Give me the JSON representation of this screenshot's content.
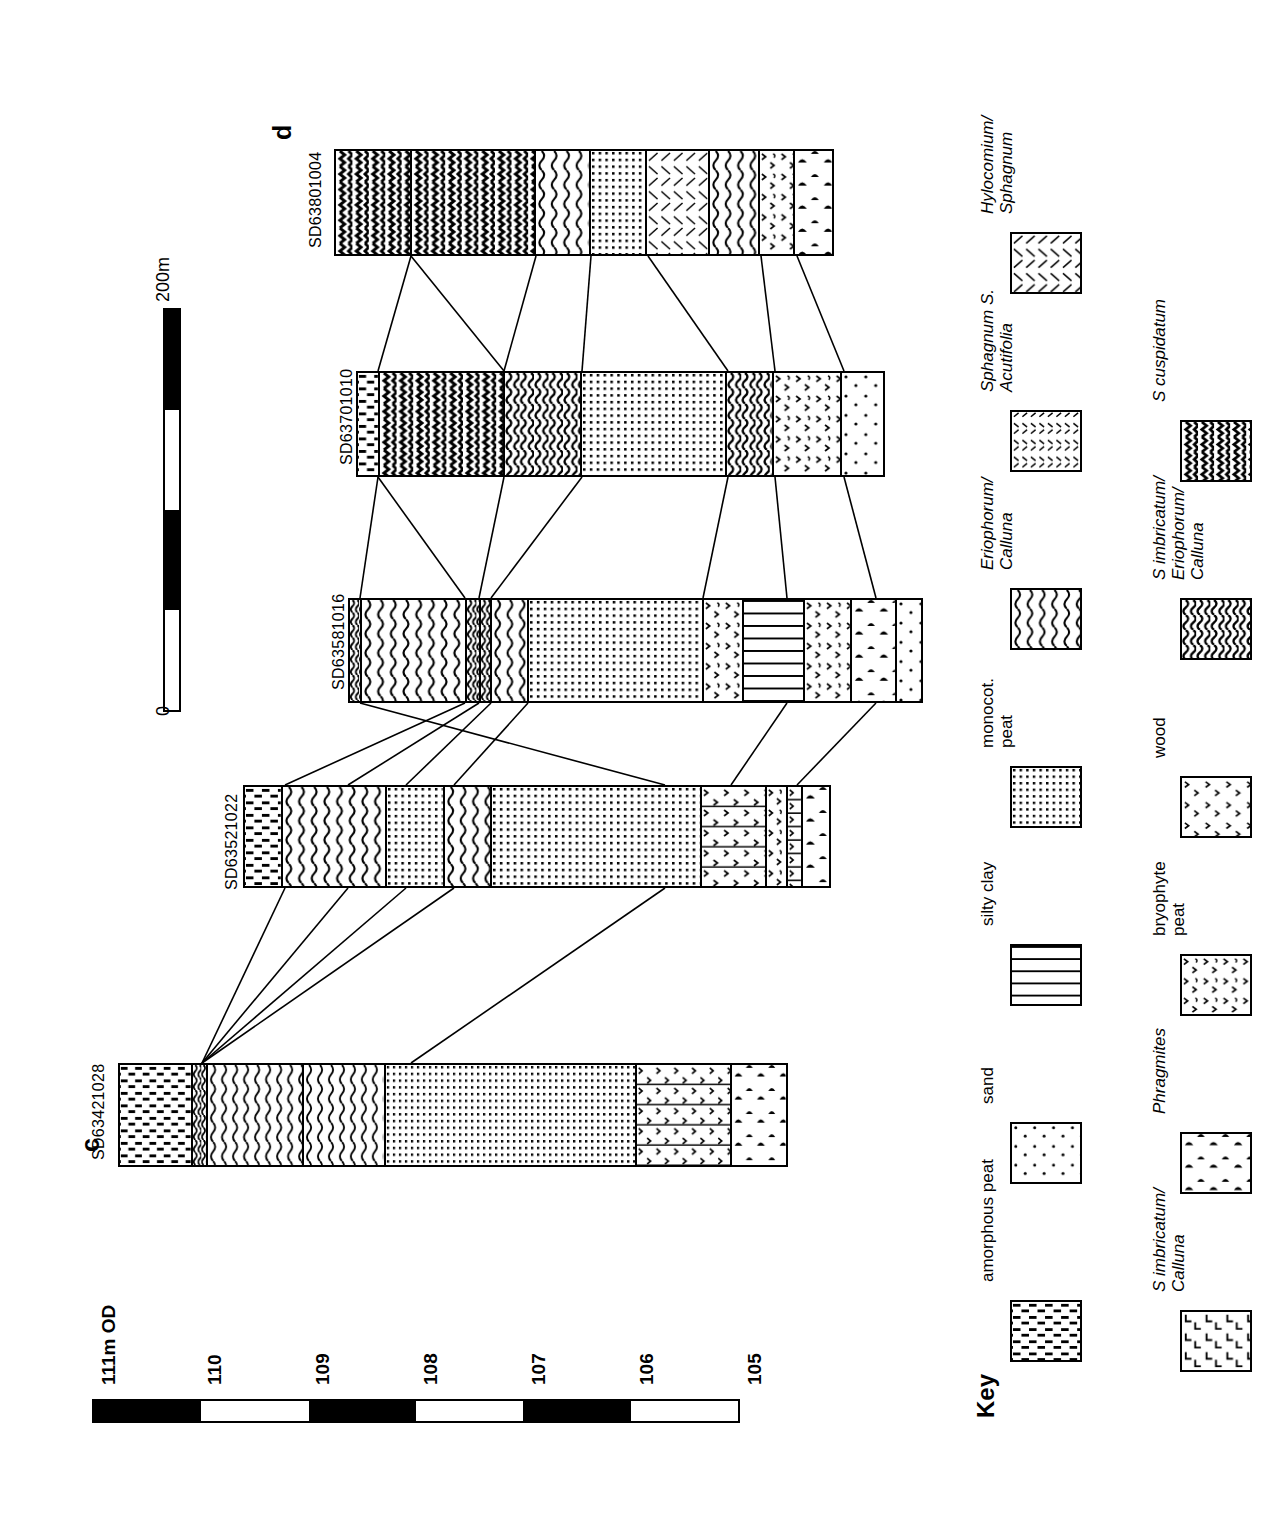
{
  "figure": {
    "panel_labels": [
      {
        "text": "c",
        "x": 76,
        "y": 1152
      },
      {
        "text": "d",
        "x": 268,
        "y": 140
      }
    ]
  },
  "elevation_scale": {
    "name": "elevation-scale",
    "unit_label": "111m OD",
    "ticks": [
      "110",
      "109",
      "108",
      "107",
      "106",
      "105"
    ],
    "segments": [
      "black",
      "white",
      "black",
      "white",
      "black",
      "white"
    ]
  },
  "distance_scale": {
    "name": "distance-scale",
    "start_label": "0",
    "end_label": "200m",
    "segments": [
      "black",
      "white",
      "black",
      "white"
    ]
  },
  "cores": [
    {
      "id": "SD63421028",
      "label_x": 90,
      "label_y": 1160,
      "bar": {
        "x": 118,
        "y": 1063,
        "w": 670,
        "h": 104
      },
      "layers": [
        {
          "name": "amorphous peat",
          "pattern": "amorphous",
          "width": 84
        },
        {
          "name": "S imbricatum/Calluna",
          "pattern": "simb",
          "width": 18
        },
        {
          "name": "Eriophorum/Calluna",
          "pattern": "erio",
          "width": 111
        },
        {
          "name": "Eriophorum/Calluna",
          "pattern": "erio",
          "width": 94
        },
        {
          "name": "monocot. peat",
          "pattern": "monocot",
          "width": 291
        },
        {
          "name": "bryophyte peat + silty clay",
          "pattern": "bryo-silty",
          "width": 110
        },
        {
          "name": "Phragmites peat",
          "pattern": "phrag",
          "width": 62
        }
      ]
    },
    {
      "id": "SD63521022",
      "label_x": 223,
      "label_y": 890,
      "bar": {
        "x": 243,
        "y": 785,
        "w": 588,
        "h": 103
      },
      "layers": [
        {
          "name": "amorphous peat",
          "pattern": "amorphous",
          "width": 38
        },
        {
          "name": "Eriophorum/Calluna",
          "pattern": "erio",
          "width": 105
        },
        {
          "name": "monocot. peat",
          "pattern": "monocot",
          "width": 58
        },
        {
          "name": "Eriophorum/Calluna",
          "pattern": "erio",
          "width": 48
        },
        {
          "name": "monocot. peat",
          "pattern": "monocot",
          "width": 211
        },
        {
          "name": "bryophyte peat + silty clay",
          "pattern": "bryo-silty",
          "width": 66
        },
        {
          "name": "bryophyte peat",
          "pattern": "bryo",
          "width": 21
        },
        {
          "name": "silty clay + wood",
          "pattern": "wood-silty",
          "width": 15
        },
        {
          "name": "Phragmites peat",
          "pattern": "phrag",
          "width": 26
        }
      ]
    },
    {
      "id": "SD63581016",
      "label_x": 330,
      "label_y": 690,
      "bar": {
        "x": 348,
        "y": 598,
        "w": 575,
        "h": 105
      },
      "layers": [
        {
          "name": "S imbricatum/Calluna",
          "pattern": "simb",
          "width": 12
        },
        {
          "name": "Eriophorum/Calluna",
          "pattern": "erio",
          "width": 105
        },
        {
          "name": "S imbricatum/Calluna",
          "pattern": "simb",
          "width": 14
        },
        {
          "name": "S imbricatum/Calluna",
          "pattern": "simb",
          "width": 12
        },
        {
          "name": "Eriophorum/Calluna",
          "pattern": "erio",
          "width": 37
        },
        {
          "name": "monocot. peat",
          "pattern": "monocot",
          "width": 175
        },
        {
          "name": "bryophyte peat",
          "pattern": "bryo",
          "width": 40
        },
        {
          "name": "silty clay",
          "pattern": "silty",
          "width": 62
        },
        {
          "name": "bryophyte peat",
          "pattern": "bryo",
          "width": 47
        },
        {
          "name": "Phragmites peat",
          "pattern": "phrag",
          "width": 45
        },
        {
          "name": "sand",
          "pattern": "sand",
          "width": 24
        }
      ]
    },
    {
      "id": "SD63701010",
      "label_x": 338,
      "label_y": 465,
      "bar": {
        "x": 356,
        "y": 371,
        "w": 529,
        "h": 106
      },
      "layers": [
        {
          "name": "amorphous peat",
          "pattern": "amorphous",
          "width": 22
        },
        {
          "name": "S cuspidatum",
          "pattern": "cusp",
          "width": 126
        },
        {
          "name": "S imbricatum/Eriophorum/Calluna",
          "pattern": "simbe",
          "width": 78
        },
        {
          "name": "monocot. peat",
          "pattern": "monocot",
          "width": 146
        },
        {
          "name": "S imbricatum/Eriophorum/Calluna",
          "pattern": "simbe",
          "width": 47
        },
        {
          "name": "bryophyte peat",
          "pattern": "bryo",
          "width": 69
        },
        {
          "name": "sand",
          "pattern": "sand",
          "width": 41
        }
      ]
    },
    {
      "id": "SD63801004",
      "label_x": 307,
      "label_y": 248,
      "bar": {
        "x": 334,
        "y": 149,
        "w": 500,
        "h": 107
      },
      "layers": [
        {
          "name": "S cuspidatum",
          "pattern": "cusp",
          "width": 77
        },
        {
          "name": "S cuspidatum",
          "pattern": "cusp",
          "width": 125
        },
        {
          "name": "Eriophorum/Calluna",
          "pattern": "erio",
          "width": 55
        },
        {
          "name": "monocot. peat",
          "pattern": "monocot",
          "width": 57
        },
        {
          "name": "Hylocomium/Sphagnum",
          "pattern": "hylo",
          "width": 63
        },
        {
          "name": "Eriophorum/Calluna",
          "pattern": "erio",
          "width": 50
        },
        {
          "name": "bryophyte peat",
          "pattern": "bryo",
          "width": 36
        },
        {
          "name": "Phragmites peat",
          "pattern": "phrag",
          "width": 37
        }
      ]
    }
  ],
  "correlation_lines": [
    {
      "x1": 202,
      "y1": 1063,
      "x2": 285,
      "y2": 888
    },
    {
      "x1": 202,
      "y1": 1063,
      "x2": 348,
      "y2": 888
    },
    {
      "x1": 202,
      "y1": 1063,
      "x2": 406,
      "y2": 888
    },
    {
      "x1": 202,
      "y1": 1063,
      "x2": 454,
      "y2": 888
    },
    {
      "x1": 411,
      "y1": 1063,
      "x2": 665,
      "y2": 888
    },
    {
      "x1": 665,
      "y1": 785,
      "x2": 360,
      "y2": 703
    },
    {
      "x1": 285,
      "y1": 785,
      "x2": 465,
      "y2": 703
    },
    {
      "x1": 348,
      "y1": 785,
      "x2": 479,
      "y2": 703
    },
    {
      "x1": 406,
      "y1": 785,
      "x2": 491,
      "y2": 703
    },
    {
      "x1": 454,
      "y1": 785,
      "x2": 528,
      "y2": 703
    },
    {
      "x1": 731,
      "y1": 785,
      "x2": 787,
      "y2": 703
    },
    {
      "x1": 797,
      "y1": 785,
      "x2": 876,
      "y2": 703
    },
    {
      "x1": 360,
      "y1": 598,
      "x2": 378,
      "y2": 477
    },
    {
      "x1": 465,
      "y1": 598,
      "x2": 378,
      "y2": 477
    },
    {
      "x1": 479,
      "y1": 598,
      "x2": 504,
      "y2": 477
    },
    {
      "x1": 491,
      "y1": 598,
      "x2": 582,
      "y2": 477
    },
    {
      "x1": 703,
      "y1": 598,
      "x2": 728,
      "y2": 477
    },
    {
      "x1": 787,
      "y1": 598,
      "x2": 775,
      "y2": 477
    },
    {
      "x1": 876,
      "y1": 598,
      "x2": 844,
      "y2": 477
    },
    {
      "x1": 378,
      "y1": 371,
      "x2": 411,
      "y2": 256
    },
    {
      "x1": 504,
      "y1": 371,
      "x2": 411,
      "y2": 256
    },
    {
      "x1": 504,
      "y1": 371,
      "x2": 536,
      "y2": 256
    },
    {
      "x1": 582,
      "y1": 371,
      "x2": 591,
      "y2": 256
    },
    {
      "x1": 728,
      "y1": 371,
      "x2": 648,
      "y2": 256
    },
    {
      "x1": 775,
      "y1": 371,
      "x2": 761,
      "y2": 256
    },
    {
      "x1": 844,
      "y1": 371,
      "x2": 797,
      "y2": 256
    }
  ],
  "key": {
    "title": "Key",
    "column_1": [
      {
        "label": "amorphous peat",
        "pattern": "amorphous",
        "italic": false
      },
      {
        "label": "sand",
        "pattern": "sand",
        "italic": false
      },
      {
        "label": "silty clay",
        "pattern": "silty",
        "italic": false
      },
      {
        "label": "monocot.\npeat",
        "pattern": "monocot",
        "italic": false
      },
      {
        "label": "Eriophorum/\nCalluna",
        "pattern": "erio",
        "italic": true
      },
      {
        "label": "Sphagnum S.\nAcutifolia",
        "pattern": "acuti",
        "italic": true
      },
      {
        "label": "Hylocomium/\nSphagnum",
        "pattern": "hylo",
        "italic": true
      }
    ],
    "column_2": [
      {
        "label": "S imbricatum/\nCalluna",
        "pattern": "simb",
        "italic": true
      },
      {
        "label": "Phragmites",
        "pattern": "phrag",
        "italic": true
      },
      {
        "label": "bryophyte\npeat",
        "pattern": "bryo",
        "italic": false
      },
      {
        "label": "wood",
        "pattern": "wood",
        "italic": false
      },
      {
        "label": "S imbricatum/\nEriophorum/\nCalluna",
        "pattern": "simbe",
        "italic": true
      },
      {
        "label": "S cuspidatum",
        "pattern": "cusp",
        "italic": true
      }
    ]
  }
}
